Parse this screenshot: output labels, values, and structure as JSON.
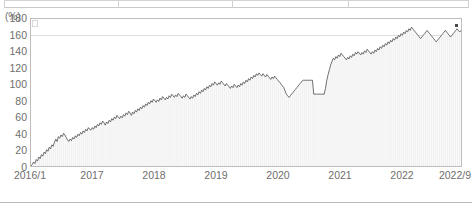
{
  "table_strip": {
    "divider_x": [
      118,
      232,
      348
    ]
  },
  "chart_data": {
    "type": "area",
    "title": "",
    "subtitle": "",
    "xlabel": "",
    "ylabel": "(%)",
    "yunit": "(%)",
    "ylim": [
      0,
      180
    ],
    "yticks": [
      180,
      160,
      140,
      120,
      100,
      80,
      60,
      40,
      20,
      0
    ],
    "xticks": [
      "2016/1",
      "2017",
      "2018",
      "2019",
      "2020",
      "2021",
      "2022",
      "2022/9"
    ],
    "xtick_positions": [
      30,
      92,
      154,
      216,
      278,
      340,
      402,
      455
    ],
    "grid": "horizontal-sparse",
    "gridlines": [
      160,
      0
    ],
    "legend_position": "top-left-inside",
    "legend_label": "",
    "line_color": "#4d4d4d",
    "fill_color": "#f2f2f2",
    "marker_color": "#4a4a4a",
    "x_start": "2016/1",
    "x_end": "2022/9",
    "series": [
      {
        "name": "cumulative-return",
        "values": [
          0,
          2,
          5,
          3,
          8,
          6,
          11,
          9,
          14,
          12,
          17,
          15,
          20,
          18,
          23,
          21,
          26,
          24,
          29,
          33,
          30,
          36,
          34,
          38,
          36,
          40,
          38,
          35,
          32,
          30,
          33,
          31,
          35,
          33,
          37,
          35,
          39,
          37,
          41,
          39,
          43,
          41,
          45,
          43,
          47,
          45,
          44,
          47,
          45,
          49,
          47,
          51,
          49,
          53,
          51,
          55,
          53,
          50,
          54,
          52,
          56,
          54,
          58,
          56,
          60,
          58,
          62,
          60,
          58,
          61,
          59,
          63,
          61,
          65,
          63,
          67,
          65,
          62,
          66,
          64,
          68,
          66,
          70,
          68,
          72,
          70,
          74,
          72,
          76,
          74,
          78,
          76,
          80,
          78,
          82,
          80,
          78,
          81,
          79,
          83,
          81,
          85,
          83,
          81,
          84,
          82,
          86,
          84,
          88,
          86,
          84,
          87,
          85,
          89,
          87,
          85,
          83,
          86,
          84,
          88,
          86,
          84,
          82,
          85,
          83,
          87,
          85,
          89,
          87,
          91,
          89,
          93,
          91,
          95,
          93,
          97,
          95,
          99,
          97,
          101,
          99,
          103,
          101,
          99,
          102,
          100,
          104,
          102,
          100,
          98,
          101,
          99,
          97,
          95,
          98,
          96,
          100,
          98,
          96,
          99,
          97,
          101,
          99,
          103,
          101,
          105,
          103,
          107,
          105,
          109,
          107,
          111,
          109,
          113,
          111,
          114,
          112,
          110,
          113,
          111,
          109,
          112,
          110,
          108,
          106,
          109,
          107,
          110,
          108,
          106,
          104,
          102,
          100,
          98,
          96,
          92,
          88,
          86,
          84,
          86,
          88,
          90,
          92,
          94,
          96,
          98,
          100,
          102,
          104,
          105,
          105,
          105,
          105,
          105,
          105,
          105,
          105,
          88,
          88,
          88,
          88,
          88,
          88,
          88,
          88,
          88,
          95,
          105,
          112,
          118,
          124,
          128,
          132,
          130,
          134,
          132,
          136,
          134,
          138,
          136,
          134,
          132,
          130,
          133,
          131,
          135,
          133,
          137,
          135,
          139,
          137,
          140,
          138,
          136,
          139,
          137,
          141,
          139,
          143,
          141,
          139,
          137,
          140,
          138,
          142,
          140,
          144,
          142,
          146,
          144,
          148,
          146,
          150,
          148,
          152,
          150,
          154,
          152,
          156,
          154,
          158,
          156,
          160,
          158,
          162,
          160,
          164,
          162,
          166,
          164,
          168,
          166,
          170,
          168,
          166,
          164,
          162,
          160,
          158,
          156,
          158,
          160,
          162,
          164,
          166,
          164,
          162,
          160,
          158,
          156,
          154,
          152,
          154,
          156,
          158,
          160,
          162,
          164,
          166,
          164,
          162,
          160,
          158,
          160,
          162,
          164,
          166,
          168,
          166,
          164,
          166
        ]
      }
    ],
    "annotations": [
      {
        "name": "last-point-marker",
        "type": "square-marker",
        "value": 166
      }
    ]
  }
}
